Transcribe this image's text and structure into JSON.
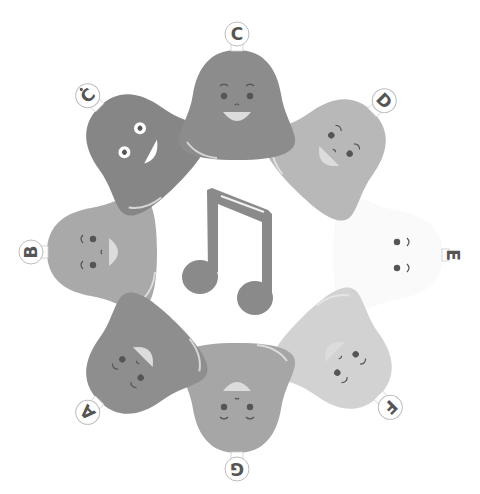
{
  "illustration": {
    "title": "Bell ring musical scale",
    "center_icon": "beamed-eighth-notes-icon",
    "colors": {
      "background": "#ffffff",
      "note": "#8a8a8a",
      "label_ring": "#bdbdbd",
      "label_text": "#555555",
      "face_features": "#555555",
      "highlight": "#e8e8e8"
    },
    "bells": [
      {
        "id": "c",
        "label": "C",
        "has_dot": false,
        "cx": 237,
        "cy": 108,
        "rot": 0,
        "color": "#8c8c8c",
        "expression": "smile"
      },
      {
        "id": "d",
        "label": "D",
        "has_dot": false,
        "cx": 332,
        "cy": 153,
        "rot": 45,
        "color": "#b8b8b8",
        "expression": "smile"
      },
      {
        "id": "e",
        "label": "E",
        "has_dot": false,
        "cx": 385,
        "cy": 255,
        "rot": 90,
        "color": "#fafafa",
        "expression": "calm"
      },
      {
        "id": "f",
        "label": "F",
        "has_dot": false,
        "cx": 338,
        "cy": 355,
        "rot": 135,
        "color": "#d2d2d2",
        "expression": "smile"
      },
      {
        "id": "g",
        "label": "G",
        "has_dot": false,
        "cx": 237,
        "cy": 395,
        "rot": 180,
        "color": "#a6a6a6",
        "expression": "smile"
      },
      {
        "id": "a",
        "label": "A",
        "has_dot": false,
        "cx": 140,
        "cy": 360,
        "rot": 225,
        "color": "#8e8e8e",
        "expression": "smile"
      },
      {
        "id": "b",
        "label": "B",
        "has_dot": false,
        "cx": 105,
        "cy": 252,
        "rot": 270,
        "color": "#a9a9a9",
        "expression": "smile"
      },
      {
        "id": "c-high",
        "label": "C",
        "has_dot": true,
        "cx": 140,
        "cy": 148,
        "rot": 315,
        "color": "#868686",
        "expression": "excited"
      }
    ]
  }
}
